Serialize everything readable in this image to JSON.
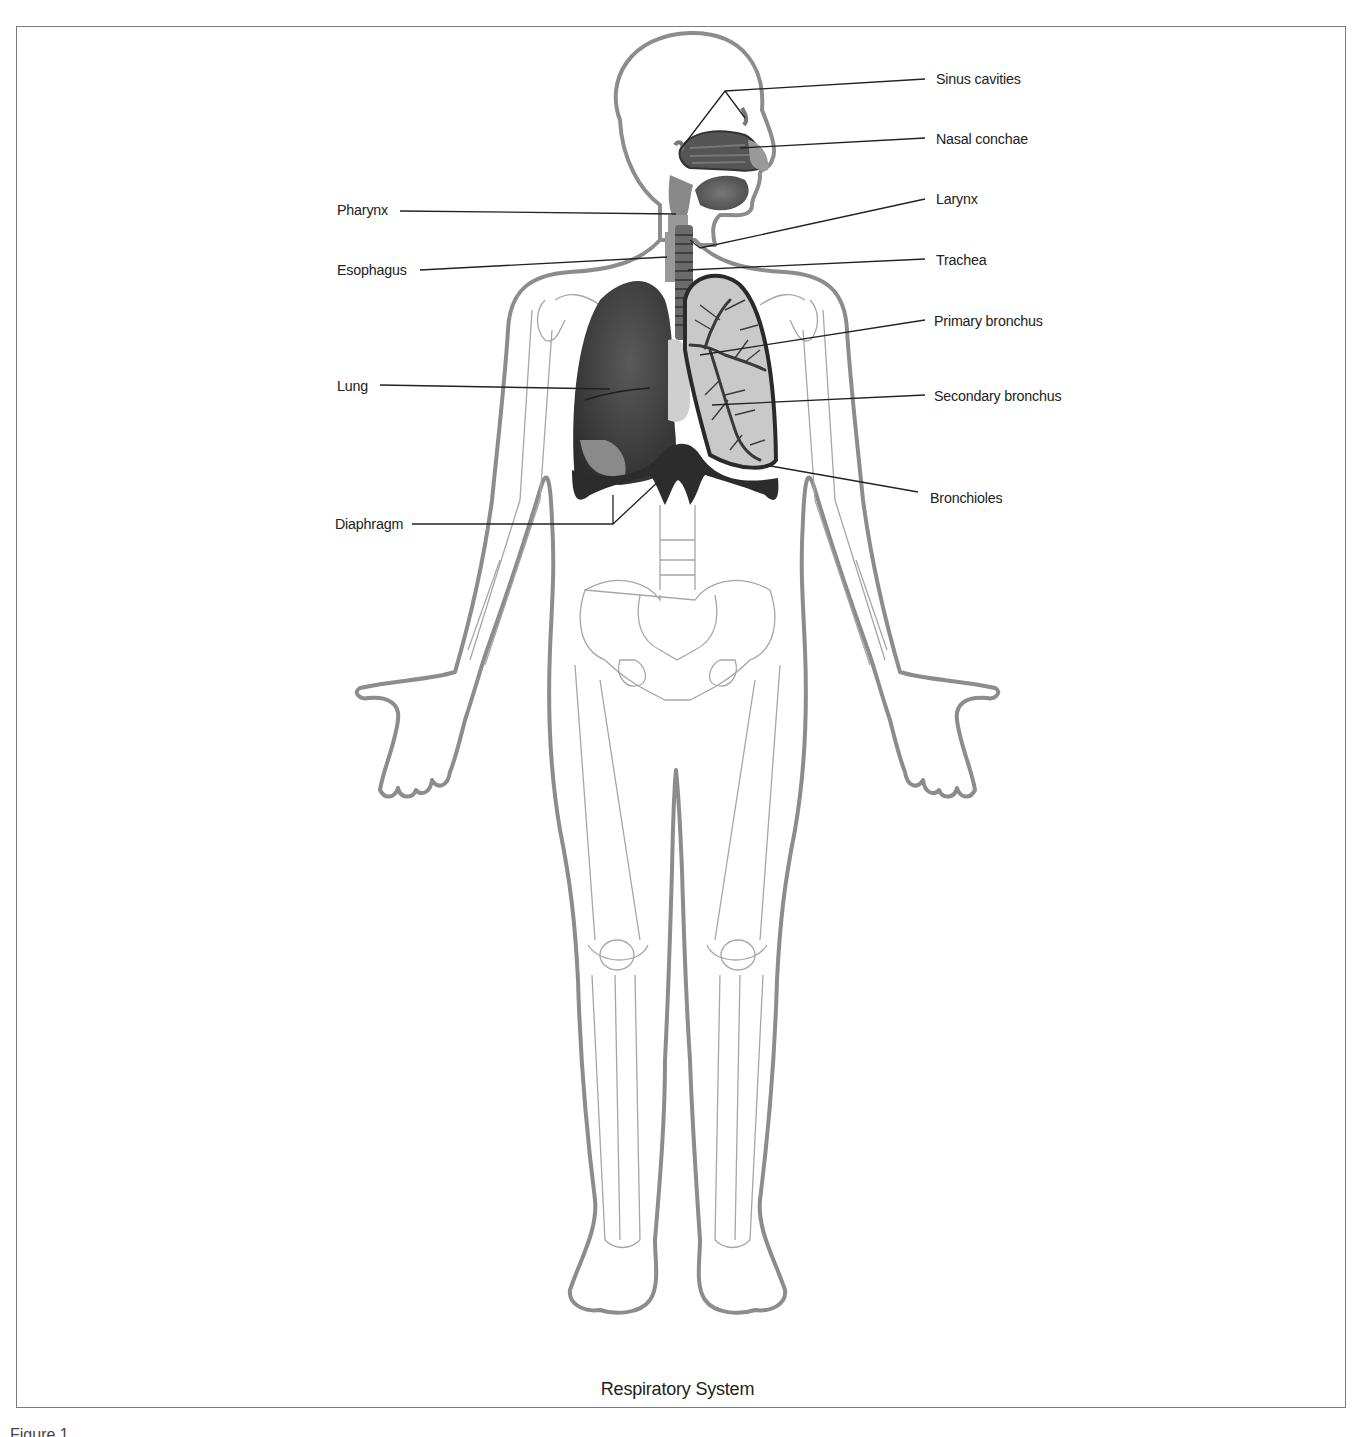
{
  "figure": {
    "title": "Respiratory System",
    "caption_fragment": "Figure 1"
  },
  "labels_left": [
    {
      "id": "pharynx",
      "text": "Pharynx"
    },
    {
      "id": "esophagus",
      "text": "Esophagus"
    },
    {
      "id": "lung",
      "text": "Lung"
    },
    {
      "id": "diaphragm",
      "text": "Diaphragm"
    }
  ],
  "labels_right": [
    {
      "id": "sinus-cavities",
      "text": "Sinus cavities"
    },
    {
      "id": "nasal-conchae",
      "text": "Nasal conchae"
    },
    {
      "id": "larynx",
      "text": "Larynx"
    },
    {
      "id": "trachea",
      "text": "Trachea"
    },
    {
      "id": "primary-bronchus",
      "text": "Primary bronchus"
    },
    {
      "id": "secondary-bronchus",
      "text": "Secondary bronchus"
    },
    {
      "id": "bronchioles",
      "text": "Bronchioles"
    }
  ],
  "colors": {
    "body_outline": "#8c8c8c",
    "organ_dark": "#3a3a3a",
    "organ_mid": "#6e6e6e",
    "lung_light": "#c9c9c9",
    "bone_line": "#9a9a9a",
    "leader_line": "#222222"
  }
}
